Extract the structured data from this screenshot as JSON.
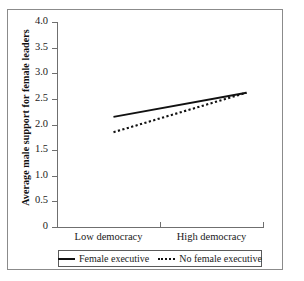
{
  "chart_data": {
    "type": "line",
    "title": "",
    "xlabel": "",
    "ylabel": "Average male support for female leaders",
    "categories": [
      "Low democracy",
      "High democracy"
    ],
    "x": [
      0,
      1
    ],
    "xlim": [
      0,
      1
    ],
    "ylim": [
      0,
      4.0
    ],
    "grid": false,
    "legend_position": "below-plot",
    "y_ticks": [
      "0",
      "0.5",
      "1.0",
      "1.5",
      "2.0",
      "2.5",
      "3.0",
      "3.5",
      "4.0"
    ],
    "y_tick_values": [
      0,
      0.5,
      1.0,
      1.5,
      2.0,
      2.5,
      3.0,
      3.5,
      4.0
    ],
    "series": [
      {
        "name": "Female executive",
        "style": "solid",
        "color": "#111111",
        "values": [
          2.15,
          2.62
        ]
      },
      {
        "name": "No female executive",
        "style": "dotted",
        "color": "#111111",
        "values": [
          1.85,
          2.62
        ]
      }
    ]
  },
  "axes": {
    "y_title": "Average male support for female leaders",
    "y_tick_labels": [
      "4.0",
      "3.5",
      "3.0",
      "2.5",
      "2.0",
      "1.5",
      "1.0",
      "0.5",
      "0"
    ],
    "x_tick_labels": [
      "Low democracy",
      "High democracy"
    ]
  },
  "legend": {
    "items": [
      {
        "label": "Female executive",
        "style": "solid"
      },
      {
        "label": "No female executive",
        "style": "dotted"
      }
    ]
  },
  "colors": {
    "line": "#111111",
    "axis": "#6f6f6f",
    "frame": "#8b8b8b",
    "background": "#ffffff"
  }
}
